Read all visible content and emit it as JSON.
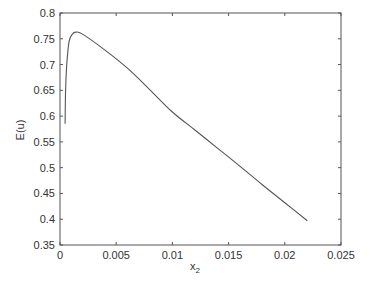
{
  "chart_data": {
    "type": "line",
    "title": "",
    "xlabel": "x",
    "xlabel_subscript": "2",
    "ylabel": "E(u)",
    "xlim": [
      0,
      0.025
    ],
    "ylim": [
      0.35,
      0.8
    ],
    "grid": false,
    "legend": null,
    "x_ticks": [
      "0",
      "0.005",
      "0.01",
      "0.015",
      "0.02",
      "0.025"
    ],
    "y_ticks": [
      "0.35",
      "0.4",
      "0.45",
      "0.5",
      "0.55",
      "0.6",
      "0.65",
      "0.7",
      "0.75",
      "0.8"
    ],
    "series": [
      {
        "name": "E(u)",
        "color": "#555555",
        "x": [
          0.00045,
          0.0005,
          0.0006,
          0.0008,
          0.0011,
          0.0014,
          0.002,
          0.004,
          0.006,
          0.008,
          0.01,
          0.012,
          0.014,
          0.016,
          0.018,
          0.02,
          0.022
        ],
        "y": [
          0.585,
          0.651,
          0.699,
          0.744,
          0.759,
          0.763,
          0.759,
          0.728,
          0.693,
          0.651,
          0.608,
          0.573,
          0.538,
          0.503,
          0.467,
          0.432,
          0.397
        ]
      }
    ]
  }
}
